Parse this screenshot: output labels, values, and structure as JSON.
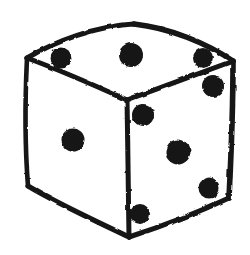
{
  "image": {
    "title": "Hand-drawn die",
    "subject": "dice-cube",
    "style": "ink sketch, rough marker outline",
    "background_color": "#ffffff",
    "ink_color": "#141414",
    "width": 250,
    "height": 255
  },
  "die": {
    "total_pips_visible": 9,
    "faces": [
      {
        "name": "top-face",
        "value": 3,
        "fill": "#ffffff",
        "outline_color": "#141414",
        "pips": [
          {
            "name": "top-face-pip-left",
            "cx": 61,
            "cy": 58,
            "r": 10.5
          },
          {
            "name": "top-face-pip-mid",
            "cx": 131,
            "cy": 55,
            "r": 12.0
          },
          {
            "name": "top-face-pip-right",
            "cx": 203,
            "cy": 58,
            "r": 10.0
          }
        ],
        "outline_path": "M 27 58 C 55 40, 95 26, 133 24 C 168 27, 205 42, 233 61 L 127 100 Z"
      },
      {
        "name": "left-face",
        "value": 1,
        "fill": "#ffffff",
        "outline_color": "#141414",
        "pips": [
          {
            "name": "left-face-pip-center",
            "cx": 73,
            "cy": 140,
            "r": 11.5
          }
        ],
        "outline_path": "M 27 58 L 127 100 L 129 237 L 28 186 Z"
      },
      {
        "name": "right-face",
        "value": 5,
        "fill": "#ffffff",
        "outline_color": "#141414",
        "pips": [
          {
            "name": "right-face-pip-top-left",
            "cx": 143,
            "cy": 115,
            "r": 11.0
          },
          {
            "name": "right-face-pip-top-right",
            "cx": 213,
            "cy": 86,
            "r": 11.0
          },
          {
            "name": "right-face-pip-center",
            "cx": 178,
            "cy": 152,
            "r": 12.5
          },
          {
            "name": "right-face-pip-bottom-left",
            "cx": 140,
            "cy": 214,
            "r": 10.0
          },
          {
            "name": "right-face-pip-bottom-right",
            "cx": 209,
            "cy": 188,
            "r": 10.5
          }
        ],
        "outline_path": "M 127 100 L 233 61 L 229 198 L 129 237 Z"
      }
    ],
    "edges": [
      {
        "name": "edge-top-back-left",
        "path": "M 27 58 C 56 41, 96 26, 134 24"
      },
      {
        "name": "edge-top-back-right",
        "path": "M 134 24 C 170 28, 206 43, 233 61"
      },
      {
        "name": "edge-top-front-left",
        "path": "M 27 58 C 60 70, 96 86, 127 100"
      },
      {
        "name": "edge-top-front-right",
        "path": "M 127 100 C 162 87, 200 73, 233 61"
      },
      {
        "name": "edge-vertical-left",
        "path": "M 27 58 C 25 100, 25 148, 28 186"
      },
      {
        "name": "edge-vertical-center",
        "path": "M 127 100 C 128 146, 128 194, 129 237"
      },
      {
        "name": "edge-vertical-right",
        "path": "M 233 61 C 233 108, 231 158, 229 198"
      },
      {
        "name": "edge-bottom-left",
        "path": "M 28 186 C 58 204, 98 222, 129 237"
      },
      {
        "name": "edge-bottom-right",
        "path": "M 129 237 C 163 226, 199 212, 229 198"
      }
    ]
  }
}
